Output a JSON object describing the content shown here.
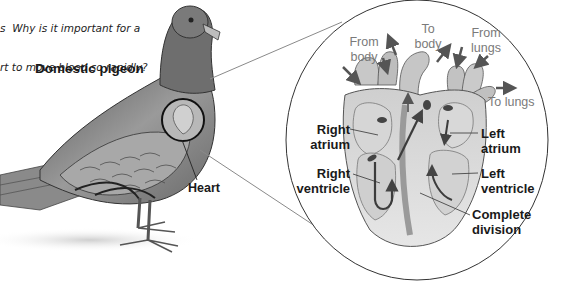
{
  "question": {
    "line1": "s  Why is it important for a",
    "line2": "rt to move blood so rapidly?"
  },
  "pigeon": {
    "title": "Domestic pigeon",
    "heart_label": "Heart"
  },
  "heart_detail": {
    "flow_labels": {
      "from_body": [
        "From",
        "body"
      ],
      "to_body": [
        "To",
        "body"
      ],
      "from_lungs": [
        "From",
        "lungs"
      ],
      "to_lungs": "To lungs"
    },
    "chambers": {
      "right_atrium": [
        "Right",
        "atrium"
      ],
      "right_ventricle": [
        "Right",
        "ventricle"
      ],
      "left_atrium": [
        "Left",
        "atrium"
      ],
      "left_ventricle": [
        "Left",
        "ventricle"
      ],
      "complete_division": [
        "Complete",
        "division"
      ]
    }
  },
  "colors": {
    "outline": "#333333",
    "connector": "#8a8a8a",
    "label_bold": "#1a1a1a",
    "label_light": "#7a7a7a",
    "tissue_light": "#e2e2e2",
    "tissue_mid": "#c4c4c4",
    "tissue_dark": "#7e7e7e"
  }
}
